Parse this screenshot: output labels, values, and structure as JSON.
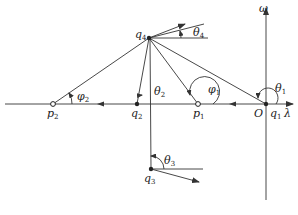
{
  "diagram": {
    "type": "root-locus-angle-diagram",
    "axes": {
      "horizontal": {
        "label": "λ"
      },
      "vertical": {
        "label": "ω"
      },
      "origin_label": "O"
    },
    "points": {
      "q1": {
        "base": "q",
        "sub": "1",
        "kind": "filled"
      },
      "q2": {
        "base": "q",
        "sub": "2",
        "kind": "filled"
      },
      "q3": {
        "base": "q",
        "sub": "3",
        "kind": "filled"
      },
      "q4": {
        "base": "q",
        "sub": "4",
        "kind": "filled"
      },
      "p1": {
        "base": "p",
        "sub": "1",
        "kind": "open"
      },
      "p2": {
        "base": "p",
        "sub": "2",
        "kind": "open"
      }
    },
    "angles": {
      "theta1": {
        "base": "θ",
        "sub": "1"
      },
      "theta2": {
        "base": "θ",
        "sub": "2"
      },
      "theta3": {
        "base": "θ",
        "sub": "3"
      },
      "theta4": {
        "base": "θ",
        "sub": "4"
      },
      "phi1": {
        "base": "φ",
        "sub": "1"
      },
      "phi2": {
        "base": "φ",
        "sub": "2"
      }
    },
    "colors": {
      "line": "#333333",
      "text": "#222222"
    }
  }
}
